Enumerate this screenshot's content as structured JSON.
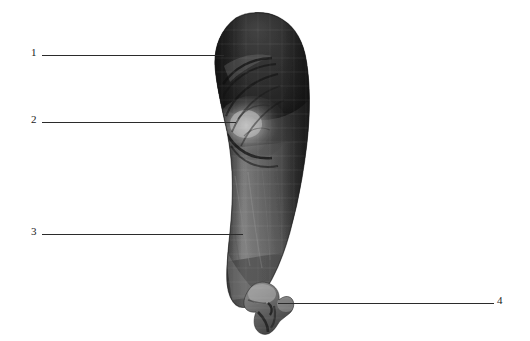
{
  "figure": {
    "kind": "labeled-anatomical-render",
    "render_style": "grayscale-3d-surface-mesh",
    "background_color": "#ffffff",
    "line_color": "#2b2b2b",
    "label_color": "#1a1a1a",
    "width": 530,
    "height": 341
  },
  "specimen": {
    "name": "limb-surface-reconstruction",
    "description": "Elongated tapering grayscale 3D surface render, broad rounded proximal end at top, narrowing distally to a small hooked terminal process at bottom",
    "shading": {
      "darkest": "#1c1c1c",
      "dark": "#3a3a3a",
      "mid": "#6a6a6a",
      "light": "#9a9a9a",
      "highlight": "#bdbdbd"
    }
  },
  "callouts": [
    {
      "id": "callout-1",
      "number": "1",
      "target": "proximal-superior-margin"
    },
    {
      "id": "callout-2",
      "number": "2",
      "target": "mid-lateral-fossa-highlight"
    },
    {
      "id": "callout-3",
      "number": "3",
      "target": "distal-shaft-anterior-border"
    },
    {
      "id": "callout-4",
      "number": "4",
      "target": "terminal-hooked-process"
    }
  ]
}
